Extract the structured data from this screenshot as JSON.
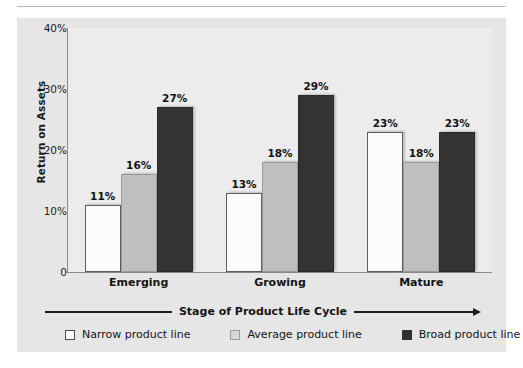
{
  "page": {
    "running_head": "RETURN ON INVESTED ASSETS"
  },
  "chart_data": {
    "type": "bar",
    "title": "",
    "xlabel": "Stage of Product Life Cycle",
    "ylabel": "Return on Assets",
    "categories": [
      "Emerging",
      "Growing",
      "Mature"
    ],
    "series": [
      {
        "name": "Narrow product line",
        "color": "#fcfcfc",
        "values": [
          11,
          16,
          27
        ]
      },
      {
        "name": "Average product line",
        "color": "#bfbfbf",
        "values": [
          13,
          18,
          29
        ]
      },
      {
        "name": "Broad product line",
        "color": "#333333",
        "values": [
          23,
          18,
          23
        ]
      }
    ],
    "bars": [
      {
        "group": "Emerging",
        "series": "Narrow product line",
        "value": 11,
        "label": "11%",
        "style": "narrow"
      },
      {
        "group": "Emerging",
        "series": "Average product line",
        "value": 16,
        "label": "16%",
        "style": "average"
      },
      {
        "group": "Emerging",
        "series": "Broad product line",
        "value": 27,
        "label": "27%",
        "style": "broad"
      },
      {
        "group": "Growing",
        "series": "Narrow product line",
        "value": 13,
        "label": "13%",
        "style": "narrow"
      },
      {
        "group": "Growing",
        "series": "Average product line",
        "value": 18,
        "label": "18%",
        "style": "average"
      },
      {
        "group": "Growing",
        "series": "Broad product line",
        "value": 29,
        "label": "29%",
        "style": "broad"
      },
      {
        "group": "Mature",
        "series": "Narrow product line",
        "value": 23,
        "label": "23%",
        "style": "narrow"
      },
      {
        "group": "Mature",
        "series": "Average product line",
        "value": 18,
        "label": "18%",
        "style": "average"
      },
      {
        "group": "Mature",
        "series": "Broad product line",
        "value": 23,
        "label": "23%",
        "style": "broad"
      }
    ],
    "ylim": [
      0,
      40
    ],
    "yticks": [
      {
        "value": 40,
        "label": "40%"
      },
      {
        "value": 30,
        "label": "30%"
      },
      {
        "value": 20,
        "label": "20%"
      },
      {
        "value": 10,
        "label": "10%"
      },
      {
        "value": 0,
        "label": "0"
      }
    ],
    "grid": false,
    "legend_position": "bottom",
    "legend": [
      {
        "label": "Narrow product line",
        "style": "narrow"
      },
      {
        "label": "Average product line",
        "style": "average"
      },
      {
        "label": "Broad product line",
        "style": "broad"
      }
    ]
  },
  "colors": {
    "panel_bg": "#e6e6e6",
    "plot_bg": "#ececec",
    "axis": "#8a8a8a",
    "text": "#141414"
  }
}
